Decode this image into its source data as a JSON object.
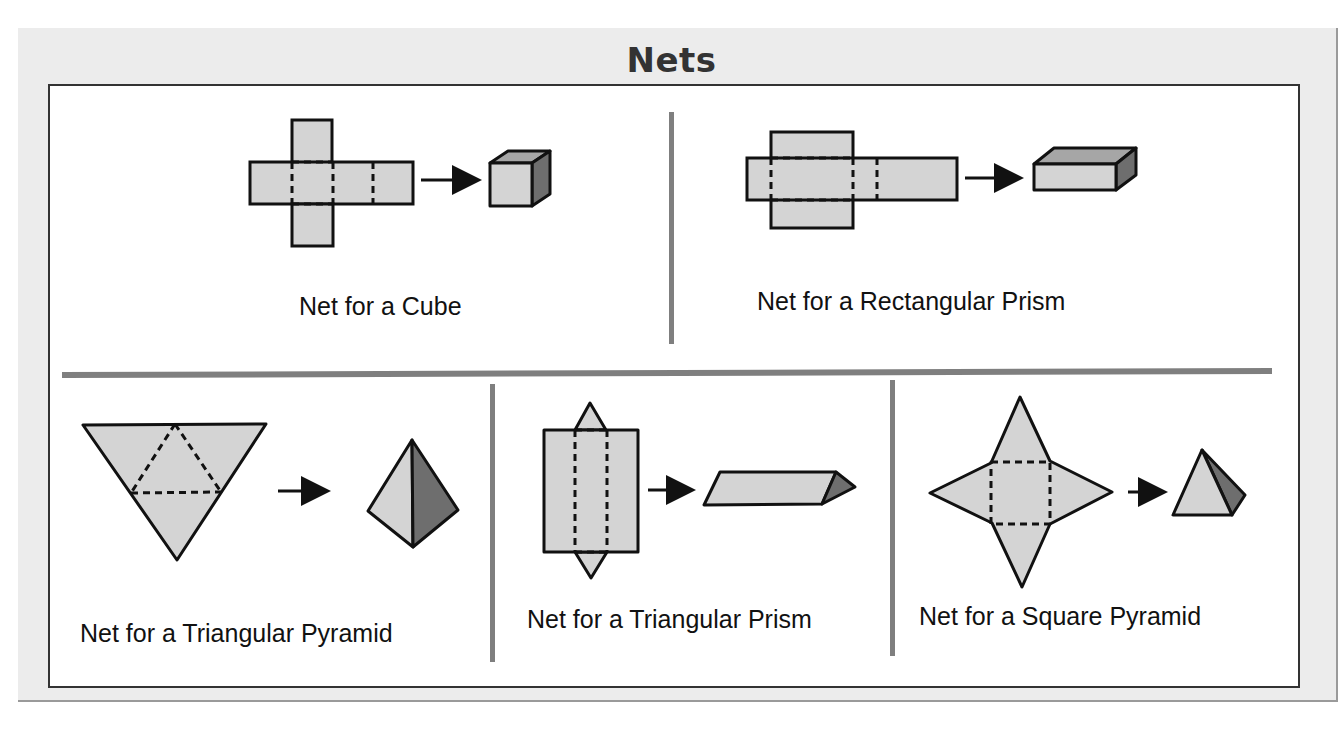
{
  "title": "Nets",
  "colors": {
    "face_light": "#d4d4d4",
    "face_mid": "#a6a6a6",
    "face_dark": "#6e6e6e",
    "outline": "#111111",
    "divider": "#7f7f7f",
    "frame_bg": "#ececec"
  },
  "panels": [
    {
      "id": "cube",
      "label": "Net for a Cube"
    },
    {
      "id": "rectangular-prism",
      "label": "Net for a Rectangular Prism"
    },
    {
      "id": "triangular-pyramid",
      "label": "Net for a Triangular Pyramid"
    },
    {
      "id": "triangular-prism",
      "label": "Net for a Triangular Prism"
    },
    {
      "id": "square-pyramid",
      "label": "Net for a Square Pyramid"
    }
  ],
  "icons": {
    "arrow": "right-arrow-icon"
  }
}
